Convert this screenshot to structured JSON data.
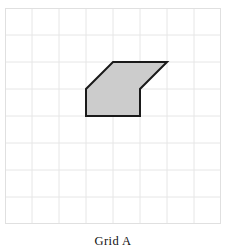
{
  "figure": {
    "caption": "Grid A",
    "grid": {
      "columns": 8,
      "rows": 8,
      "cell_size": 27,
      "origin_x": 5,
      "origin_y": 8,
      "line_color": "#e6e6e6",
      "border_color": "#e0e0e0",
      "background_color": "#ffffff"
    },
    "shape": {
      "name": "hexagon-arrow-polygon",
      "vertex_count": 6,
      "fill_color": "#cccccc",
      "stroke_color": "#1a1a1a",
      "stroke_width": 2,
      "vertices_grid": [
        [
          4,
          2
        ],
        [
          6,
          2
        ],
        [
          5,
          3
        ],
        [
          5,
          4
        ],
        [
          3,
          4
        ],
        [
          3,
          3
        ]
      ],
      "vertices_px": [
        [
          113,
          62
        ],
        [
          167,
          62
        ],
        [
          140,
          89
        ],
        [
          140,
          116
        ],
        [
          86,
          116
        ],
        [
          86,
          89
        ]
      ]
    }
  }
}
